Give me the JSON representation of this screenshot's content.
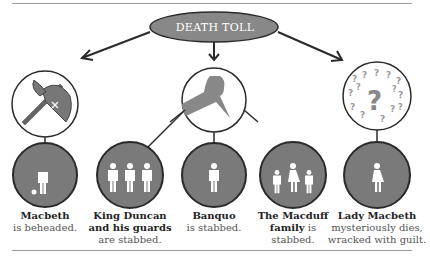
{
  "title": "DEATH TOLL",
  "colors": {
    "circle_fill": "#7a7a7a",
    "outline": "#2a2a2a",
    "figure": "#ffffff",
    "ellipse_fill": "#888888",
    "rule": "#9a9a9a"
  },
  "methods": [
    {
      "name": "axe",
      "icon": "axe-icon"
    },
    {
      "name": "knife",
      "icon": "knife-icon"
    },
    {
      "name": "mystery",
      "icon": "question-marks-icon"
    }
  ],
  "victims": [
    {
      "name": "Macbeth",
      "fate": "is beheaded.",
      "icon": "headless-person-icon"
    },
    {
      "name": "King Duncan and his guards",
      "name_line1": "King Duncan",
      "name_line2": "and his guards",
      "fate": "are stabbed.",
      "icon": "three-people-icon"
    },
    {
      "name": "Banquo",
      "fate": "is stabbed.",
      "icon": "person-icon"
    },
    {
      "name": "The Macduff family",
      "name_line1": "The Macduff",
      "name_line2": "family",
      "fate_inline": "is",
      "fate": "stabbed.",
      "icon": "family-icon"
    },
    {
      "name": "Lady Macbeth",
      "fate": "mysteriously dies,",
      "fate_line2": "wracked with guilt.",
      "icon": "woman-icon"
    }
  ]
}
